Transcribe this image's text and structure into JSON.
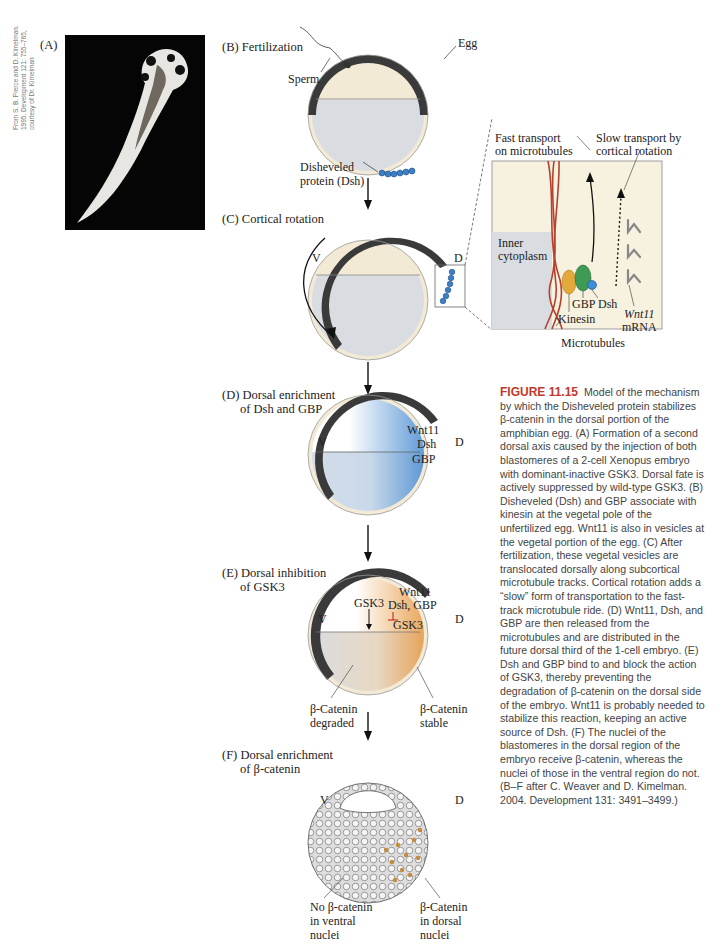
{
  "figure": {
    "number": "FIGURE 11.15",
    "caption": "Model of the mechanism by which the Disheveled protein stabilizes β-catenin in the dorsal portion of the amphibian egg. (A) Formation of a second dorsal axis caused by the injection of both blastomeres of a 2-cell Xenopus embryo with dominant-inactive GSK3. Dorsal fate is actively suppressed by wild-type GSK3. (B) Disheveled (Dsh) and GBP associate with kinesin at the vegetal pole of the unfertilized egg. Wnt11 is also in vesicles at the vegetal portion of the egg. (C) After fertilization, these vegetal vesicles are translocated dorsally along subcortical microtubule tracks. Cortical rotation adds a “slow” form of transportation to the fast-track microtubule ride. (D) Wnt11, Dsh, and GBP are then released from the microtubules and are distributed in the future dorsal third of the 1-cell embryo. (E) Dsh and GBP bind to and block the action of GSK3, thereby preventing the degradation of β-catenin on the dorsal side of the embryo. Wnt11 is probably needed to stabilize this reaction, keeping an active source of Dsh. (F) The nuclei of the blastomeres in the dorsal region of the embryo receive β-catenin, whereas the nuclei of those in the ventral region do not. (B–F after C. Weaver and D. Kimelman. 2004. Development 131: 3491–3499.)"
  },
  "panelA": {
    "label": "(A)",
    "credit": "From S. B. Pierce and D. Kimelman.\n1995. Development 121: 755–765,\ncourtesy of Dr. Kimelman"
  },
  "panelB": {
    "label": "(B)  Fertilization",
    "egg": "Egg",
    "sperm": "Sperm",
    "dsh1": "Disheveled",
    "dsh2": "protein (Dsh)"
  },
  "panelC": {
    "label": "(C)  Cortical rotation",
    "v": "V",
    "d": "D"
  },
  "inset": {
    "fast1": "Fast transport",
    "fast2": "on microtubules",
    "slow1": "Slow transport by",
    "slow2": "cortical rotation",
    "inner1": "Inner",
    "inner2": "cytoplasm",
    "gbp": "GBP",
    "dsh": "Dsh",
    "kinesin": "Kinesin",
    "wnt11": "Wnt11",
    "mrna": "mRNA",
    "microtubules": "Microtubules"
  },
  "panelD": {
    "label1": "(D)  Dorsal enrichment",
    "label2": "of Dsh and GBP",
    "v": "V",
    "d": "D",
    "wnt11": "Wnt11",
    "dsh": "Dsh",
    "gbp": "GBP"
  },
  "panelE": {
    "label1": "(E)  Dorsal inhibition",
    "label2": "of GSK3",
    "v": "V",
    "d": "D",
    "gsk3_left": "GSK3",
    "wnt11": "Wnt11",
    "dshgbp": "Dsh, GBP",
    "gsk3_right": "GSK3",
    "deg1": "β-Catenin",
    "deg2": "degraded",
    "stab1": "β-Catenin",
    "stab2": "stable"
  },
  "panelF": {
    "label1": "(F)  Dorsal enrichment",
    "label2": "of β-catenin",
    "v": "V",
    "d": "D",
    "no1": "No β-catenin",
    "no2": "in ventral",
    "no3": "nuclei",
    "yes1": "β-Catenin",
    "yes2": "in dorsal",
    "yes3": "nuclei"
  },
  "colors": {
    "pigment": "#3a3a3a",
    "cortex": "#f3ead6",
    "yolk": "#d9dde2",
    "dsh": "#3d7fc4",
    "microtubule": "#b5412f",
    "orange": "#e08a2e",
    "caption_accent": "#c0392b"
  }
}
